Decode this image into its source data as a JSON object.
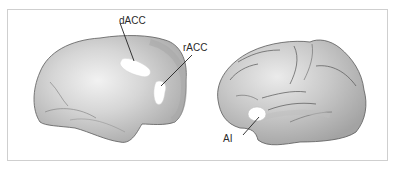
{
  "figure": {
    "panels": [
      {
        "name": "medial-view",
        "description": "Medial surface of brain hemisphere",
        "labels": [
          {
            "id": "dACC",
            "text": "dACC"
          },
          {
            "id": "rACC",
            "text": "rACC"
          }
        ]
      },
      {
        "name": "lateral-view",
        "description": "Lateral surface of brain hemisphere",
        "labels": [
          {
            "id": "AI",
            "text": "AI"
          }
        ]
      }
    ],
    "colors": {
      "brain_fill": "#b8b8b8",
      "brain_highlight": "#e6e6e6",
      "region_fill": "#ffffff",
      "outline": "#555555",
      "border": "#cfcfcf",
      "text": "#2a2a2a"
    }
  }
}
